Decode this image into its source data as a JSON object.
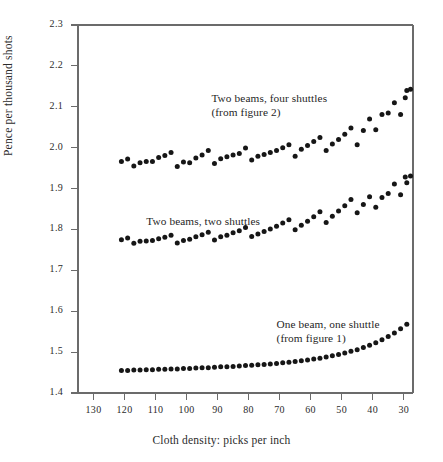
{
  "chart_data": {
    "type": "scatter",
    "title": "",
    "xlabel": "Cloth density: picks per inch",
    "ylabel": "Pence per thousand shots",
    "xlim": [
      135,
      27
    ],
    "ylim": [
      1.4,
      2.3
    ],
    "x_ticks": [
      130,
      120,
      110,
      100,
      90,
      80,
      70,
      60,
      50,
      40,
      30
    ],
    "y_ticks": [
      "1.4",
      "1.5",
      "1.6",
      "1.7",
      "1.8",
      "1.9",
      "2.0",
      "2.1",
      "2.2",
      "2.3"
    ],
    "x_axis_reversed": true,
    "grid": false,
    "legend": "inline-annotations",
    "marker": "filled-circle",
    "marker_color": "#161616",
    "axis_color": "#6b6b6b",
    "series": [
      {
        "name": "Two beams, four shuttles",
        "source_note": "(from figure 2)",
        "annotation_x": 92,
        "annotation_y": 2.12,
        "x": [
          121,
          119,
          117,
          115,
          113,
          111,
          109,
          107,
          105,
          103,
          101,
          99,
          97,
          95,
          93,
          91,
          89,
          87,
          85,
          83,
          81,
          79,
          77,
          75,
          73,
          71,
          69,
          67,
          65,
          63,
          61,
          59,
          57,
          55,
          53,
          51,
          49,
          47,
          45,
          43,
          41,
          39,
          37,
          35,
          33,
          31,
          29
        ],
        "y": [
          1.966,
          1.972,
          1.955,
          1.963,
          1.966,
          1.966,
          1.976,
          1.981,
          1.988,
          1.954,
          1.965,
          1.963,
          1.975,
          1.982,
          1.993,
          1.961,
          1.973,
          1.978,
          1.982,
          1.986,
          1.999,
          1.97,
          1.979,
          1.983,
          1.988,
          1.993,
          2.0,
          2.007,
          1.979,
          1.996,
          2.005,
          2.015,
          2.025,
          1.993,
          2.009,
          2.02,
          2.033,
          2.048,
          2.007,
          2.042,
          2.07,
          2.044,
          2.081,
          2.085,
          2.11,
          2.081,
          2.14
        ],
        "extra_points": [
          {
            "x": 29.5,
            "y": 2.122
          },
          {
            "x": 27.8,
            "y": 2.143
          }
        ]
      },
      {
        "name": "Two beams, two shuttles",
        "source_note": "",
        "annotation_x": 113,
        "annotation_y": 1.818,
        "x": [
          121,
          119,
          117,
          115,
          113,
          111,
          109,
          107,
          105,
          103,
          101,
          99,
          97,
          95,
          93,
          91,
          89,
          87,
          85,
          83,
          81,
          79,
          77,
          75,
          73,
          71,
          69,
          67,
          65,
          63,
          61,
          59,
          57,
          55,
          53,
          51,
          49,
          47,
          45,
          43,
          41,
          39,
          37,
          35,
          33,
          31,
          29
        ],
        "y": [
          1.775,
          1.779,
          1.766,
          1.771,
          1.772,
          1.773,
          1.777,
          1.781,
          1.786,
          1.767,
          1.773,
          1.776,
          1.782,
          1.787,
          1.793,
          1.774,
          1.782,
          1.786,
          1.792,
          1.797,
          1.805,
          1.783,
          1.789,
          1.795,
          1.801,
          1.808,
          1.816,
          1.824,
          1.799,
          1.81,
          1.82,
          1.831,
          1.843,
          1.817,
          1.832,
          1.845,
          1.858,
          1.873,
          1.841,
          1.861,
          1.88,
          1.854,
          1.878,
          1.888,
          1.911,
          1.885,
          1.914
        ],
        "extra_points": [
          {
            "x": 29.5,
            "y": 1.928
          },
          {
            "x": 27.8,
            "y": 1.931
          }
        ]
      },
      {
        "name": "One beam, one shuttle",
        "source_note": "(from figure 1)",
        "annotation_x": 71,
        "annotation_y": 1.566,
        "x": [
          121,
          119,
          117,
          115,
          113,
          111,
          109,
          107,
          105,
          103,
          101,
          99,
          97,
          95,
          93,
          91,
          89,
          87,
          85,
          83,
          81,
          79,
          77,
          75,
          73,
          71,
          69,
          67,
          65,
          63,
          61,
          59,
          57,
          55,
          53,
          51,
          49,
          47,
          45,
          43,
          41,
          39,
          37,
          35,
          33,
          31,
          29
        ],
        "y": [
          1.455,
          1.455,
          1.456,
          1.456,
          1.457,
          1.457,
          1.458,
          1.458,
          1.459,
          1.459,
          1.46,
          1.46,
          1.461,
          1.462,
          1.462,
          1.463,
          1.464,
          1.464,
          1.465,
          1.466,
          1.467,
          1.468,
          1.469,
          1.47,
          1.471,
          1.472,
          1.474,
          1.475,
          1.477,
          1.479,
          1.481,
          1.483,
          1.485,
          1.488,
          1.491,
          1.494,
          1.498,
          1.502,
          1.506,
          1.511,
          1.517,
          1.523,
          1.53,
          1.538,
          1.547,
          1.557,
          1.568
        ],
        "extra_points": []
      }
    ]
  }
}
